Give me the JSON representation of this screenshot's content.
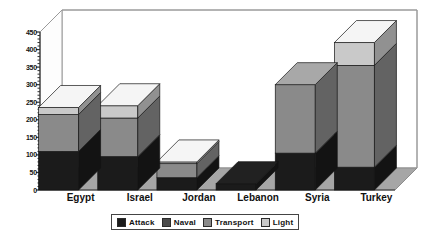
{
  "chart_data": {
    "type": "bar",
    "subtype": "stacked-3d-column",
    "title": "",
    "xlabel": "",
    "ylabel": "",
    "ylim": [
      0,
      450
    ],
    "ytick_step": 50,
    "yticks": [
      0,
      50,
      100,
      150,
      200,
      250,
      300,
      350,
      400,
      450
    ],
    "grid": false,
    "legend_position": "bottom",
    "categories": [
      "Egypt",
      "Israel",
      "Jordan",
      "Lebanon",
      "Syria",
      "Turkey"
    ],
    "series": [
      {
        "name": "Attack",
        "color": "#1b1b1b",
        "values": [
          110,
          95,
          35,
          18,
          105,
          65
        ]
      },
      {
        "name": "Naval",
        "color": "#4a4a4a",
        "values": [
          0,
          0,
          0,
          0,
          0,
          0
        ]
      },
      {
        "name": "Transport",
        "color": "#8a8a8a",
        "values": [
          105,
          110,
          40,
          0,
          195,
          290
        ]
      },
      {
        "name": "Light",
        "color": "#c9c9c9",
        "values": [
          20,
          35,
          5,
          0,
          0,
          65
        ]
      }
    ],
    "totals": [
      235,
      240,
      80,
      18,
      300,
      420
    ]
  },
  "axis": {
    "ytick_labels": [
      "450",
      "400",
      "350",
      "300",
      "250",
      "200",
      "150",
      "100",
      "50",
      "0"
    ]
  },
  "legend": {
    "entries": [
      {
        "label": "Attack",
        "color": "#1b1b1b"
      },
      {
        "label": "Naval",
        "color": "#4a4a4a"
      },
      {
        "label": "Transport",
        "color": "#8a8a8a"
      },
      {
        "label": "Light",
        "color": "#c9c9c9"
      }
    ]
  },
  "style": {
    "plot_background": "#ffffff",
    "floor_color": "#a6a6a6",
    "frame_color": "#9a9a9a",
    "axis_color": "#333333",
    "text_color": "#111111"
  }
}
